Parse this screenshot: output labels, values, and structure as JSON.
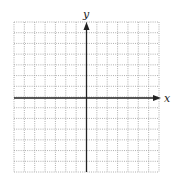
{
  "diagram": {
    "type": "coordinate-plane",
    "x_axis_label": "x",
    "y_axis_label": "y",
    "grid": {
      "columns": 14,
      "rows": 14,
      "line_style": "dotted"
    },
    "colors": {
      "grid": "#9a9a9a",
      "axis": "#222222",
      "background": "#ffffff"
    }
  }
}
